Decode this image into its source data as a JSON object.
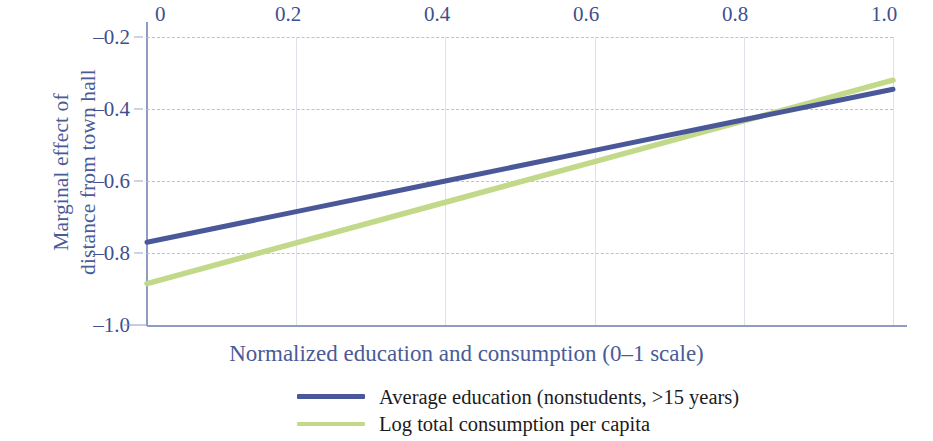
{
  "chart_data": {
    "type": "line",
    "title": "",
    "subtitle": "",
    "xlabel": "Normalized education and consumption (0–1 scale)",
    "ylabel": "Marginal effect of distance from town hall",
    "ylabel_lines": [
      "Marginal effect of",
      "distance from town hall"
    ],
    "xlim": [
      0,
      1.0
    ],
    "ylim": [
      -1.0,
      -0.2
    ],
    "x_axis_position": "top",
    "xticks": [
      0,
      0.2,
      0.4,
      0.6,
      0.8,
      1.0
    ],
    "xtick_labels": [
      "0",
      "0.2",
      "0.4",
      "0.6",
      "0.8",
      "1.0"
    ],
    "yticks": [
      -0.2,
      -0.4,
      -0.6,
      -0.8,
      -1.0
    ],
    "ytick_labels": [
      "–0.2",
      "–0.4",
      "–0.6",
      "–0.8",
      "–1.0"
    ],
    "grid": true,
    "grid_style": "dashed horizontal, light solid vertical",
    "legend_position": "bottom-center",
    "series": [
      {
        "name": "Average education (nonstudents, >15 years)",
        "color": "#4a5899",
        "x": [
          0,
          0.2,
          0.4,
          0.6,
          0.8,
          1.0
        ],
        "values": [
          -0.77,
          -0.685,
          -0.6,
          -0.515,
          -0.43,
          -0.345
        ]
      },
      {
        "name": "Log total consumption per capita",
        "color": "#c3d98a",
        "x": [
          0,
          0.2,
          0.4,
          0.6,
          0.8,
          1.0
        ],
        "values": [
          -0.885,
          -0.772,
          -0.659,
          -0.546,
          -0.433,
          -0.32
        ]
      }
    ],
    "annotations": [
      {
        "text": "series cross",
        "x": 0.82,
        "y": -0.425
      }
    ]
  },
  "axes": {
    "x": {
      "title": "Normalized education and consumption (0–1 scale)",
      "ticks": [
        {
          "label": "0",
          "value": 0
        },
        {
          "label": "0.2",
          "value": 0.2
        },
        {
          "label": "0.4",
          "value": 0.4
        },
        {
          "label": "0.6",
          "value": 0.6
        },
        {
          "label": "0.8",
          "value": 0.8
        },
        {
          "label": "1.0",
          "value": 1.0
        }
      ]
    },
    "y": {
      "title_line1": "Marginal effect of",
      "title_line2": "distance from town hall",
      "ticks": [
        {
          "label": "–0.2",
          "value": -0.2
        },
        {
          "label": "–0.4",
          "value": -0.4
        },
        {
          "label": "–0.6",
          "value": -0.6
        },
        {
          "label": "–0.8",
          "value": -0.8
        },
        {
          "label": "–1.0",
          "value": -1.0
        }
      ]
    }
  },
  "legend": {
    "items": [
      {
        "label": "Average education (nonstudents, >15 years)",
        "color": "#4a5899"
      },
      {
        "label": "Log total consumption per capita",
        "color": "#c3d98a"
      }
    ]
  },
  "colors": {
    "series_blue": "#4a5899",
    "series_green": "#c3d98a",
    "axis_text": "#3f4f8f",
    "axis_title": "#4a5b96",
    "axis_line": "#8e9cc4",
    "grid": "#b9c2d8",
    "legend_text": "#1b1b1b",
    "background": "#ffffff"
  }
}
